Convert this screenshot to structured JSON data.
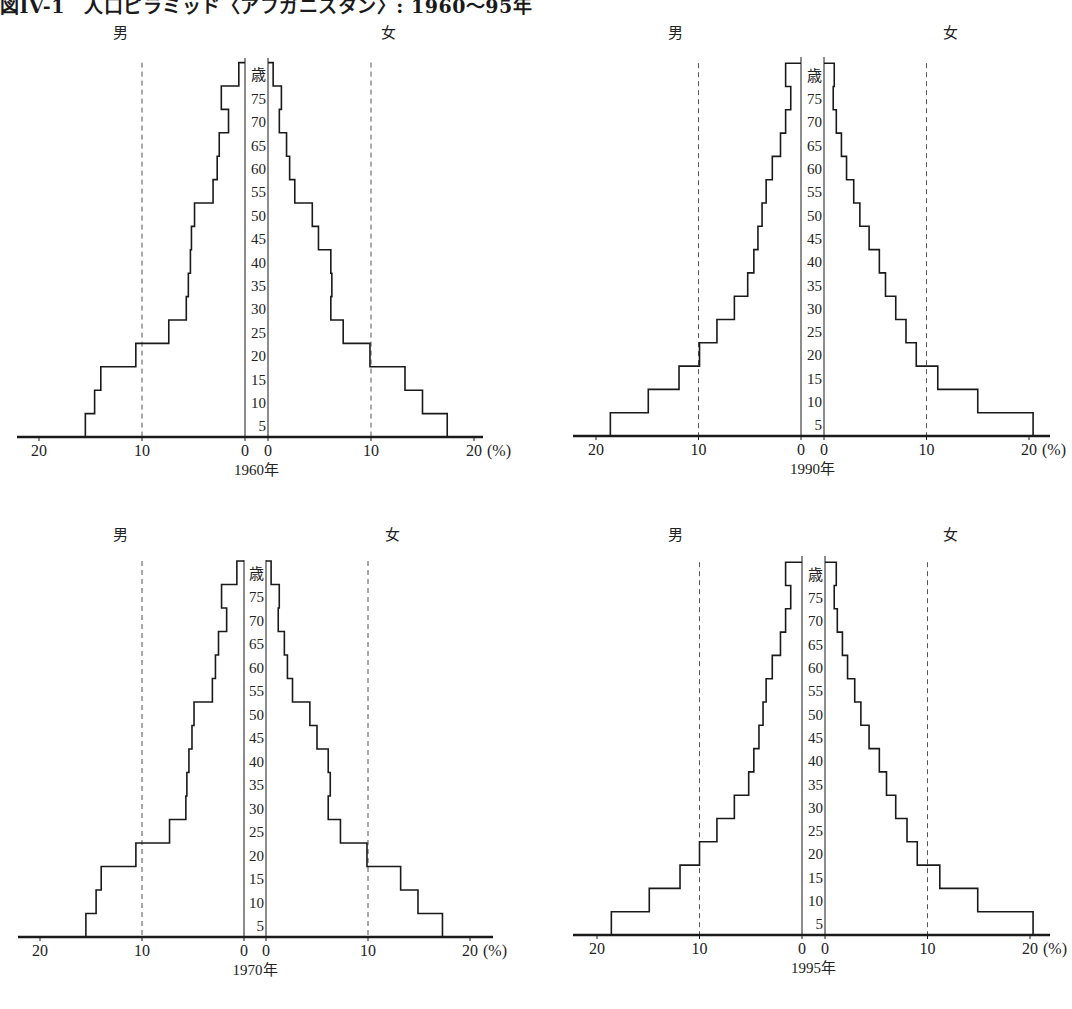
{
  "title": "図IV-1　人口ピラミッド〈アフガニスタン〉: 1960～95年",
  "labels": {
    "male": "男",
    "female": "女",
    "age_unit": "歳",
    "percent_unit": "(%)"
  },
  "chart_data": [
    {
      "type": "population_pyramid",
      "title": "1960年",
      "year": 1960,
      "xlabel": "%",
      "ylabel": "歳",
      "age_bands": [
        "0-4",
        "5-9",
        "10-14",
        "15-19",
        "20-24",
        "25-29",
        "30-34",
        "35-39",
        "40-44",
        "45-49",
        "50-54",
        "55-59",
        "60-64",
        "65-69",
        "70-74",
        "75+"
      ],
      "age_tick_labels": [
        "5",
        "10",
        "15",
        "20",
        "25",
        "30",
        "35",
        "40",
        "45",
        "50",
        "55",
        "60",
        "65",
        "70",
        "75",
        "歳"
      ],
      "x_ticks_male": [
        "20",
        "10",
        "0"
      ],
      "x_ticks_female": [
        "0",
        "10",
        "20"
      ],
      "xlim": [
        0,
        20
      ],
      "gridlines": [
        10
      ],
      "series": [
        {
          "name": "男",
          "values": [
            15.5,
            14.6,
            14.0,
            10.6,
            7.4,
            5.7,
            5.5,
            5.3,
            5.2,
            4.9,
            3.1,
            2.7,
            2.5,
            1.6,
            2.3,
            0.6
          ]
        },
        {
          "name": "女",
          "values": [
            17.4,
            15.0,
            13.3,
            9.9,
            7.3,
            6.1,
            6.2,
            6.1,
            4.9,
            4.3,
            2.6,
            2.1,
            1.8,
            1.1,
            1.3,
            0.5
          ]
        }
      ]
    },
    {
      "type": "population_pyramid",
      "title": "1990年",
      "year": 1990,
      "xlabel": "%",
      "ylabel": "歳",
      "age_bands": [
        "0-4",
        "5-9",
        "10-14",
        "15-19",
        "20-24",
        "25-29",
        "30-34",
        "35-39",
        "40-44",
        "45-49",
        "50-54",
        "55-59",
        "60-64",
        "65-69",
        "70-74",
        "75+"
      ],
      "age_tick_labels": [
        "5",
        "10",
        "15",
        "20",
        "25",
        "30",
        "35",
        "40",
        "45",
        "50",
        "55",
        "60",
        "65",
        "70",
        "75",
        "歳"
      ],
      "x_ticks_male": [
        "20",
        "10",
        "0"
      ],
      "x_ticks_female": [
        "0",
        "10",
        "20"
      ],
      "xlim": [
        0,
        20
      ],
      "gridlines": [
        10
      ],
      "series": [
        {
          "name": "男",
          "values": [
            18.6,
            14.9,
            11.9,
            9.9,
            8.2,
            6.5,
            5.2,
            4.6,
            4.2,
            3.8,
            3.4,
            2.8,
            2.0,
            1.5,
            1.0,
            1.5
          ]
        },
        {
          "name": "女",
          "values": [
            20.4,
            15.0,
            11.1,
            9.0,
            8.0,
            7.0,
            6.0,
            5.4,
            4.4,
            3.5,
            2.9,
            2.2,
            1.7,
            1.2,
            0.9,
            1.0
          ]
        }
      ]
    },
    {
      "type": "population_pyramid",
      "title": "1970年",
      "year": 1970,
      "xlabel": "%",
      "ylabel": "歳",
      "age_bands": [
        "0-4",
        "5-9",
        "10-14",
        "15-19",
        "20-24",
        "25-29",
        "30-34",
        "35-39",
        "40-44",
        "45-49",
        "50-54",
        "55-59",
        "60-64",
        "65-69",
        "70-74",
        "75+"
      ],
      "age_tick_labels": [
        "5",
        "10",
        "15",
        "20",
        "25",
        "30",
        "35",
        "40",
        "45",
        "50",
        "55",
        "60",
        "65",
        "70",
        "75",
        "歳"
      ],
      "x_ticks_male": [
        "20",
        "10",
        "0"
      ],
      "x_ticks_female": [
        "0",
        "10",
        "20"
      ],
      "xlim": [
        0,
        20
      ],
      "gridlines": [
        10
      ],
      "series": [
        {
          "name": "男",
          "values": [
            15.5,
            14.5,
            14.0,
            10.6,
            7.3,
            5.7,
            5.6,
            5.4,
            5.1,
            4.9,
            3.1,
            2.8,
            2.5,
            1.7,
            2.2,
            0.7
          ]
        },
        {
          "name": "女",
          "values": [
            17.3,
            14.9,
            13.2,
            9.9,
            7.3,
            6.1,
            6.3,
            6.1,
            5.0,
            4.3,
            2.6,
            2.1,
            1.8,
            1.2,
            1.3,
            0.5
          ]
        }
      ]
    },
    {
      "type": "population_pyramid",
      "title": "1995年",
      "year": 1995,
      "xlabel": "%",
      "ylabel": "歳",
      "age_bands": [
        "0-4",
        "5-9",
        "10-14",
        "15-19",
        "20-24",
        "25-29",
        "30-34",
        "35-39",
        "40-44",
        "45-49",
        "50-54",
        "55-59",
        "60-64",
        "65-69",
        "70-74",
        "75+"
      ],
      "age_tick_labels": [
        "5",
        "10",
        "15",
        "20",
        "25",
        "30",
        "35",
        "40",
        "45",
        "50",
        "55",
        "60",
        "65",
        "70",
        "75",
        "歳"
      ],
      "x_ticks_male": [
        "20",
        "10",
        "0"
      ],
      "x_ticks_female": [
        "0",
        "10",
        "20"
      ],
      "xlim": [
        0,
        20
      ],
      "gridlines": [
        10
      ],
      "series": [
        {
          "name": "男",
          "values": [
            18.6,
            14.9,
            11.9,
            10.0,
            8.3,
            6.6,
            5.2,
            4.7,
            4.2,
            3.8,
            3.5,
            2.9,
            2.1,
            1.6,
            1.1,
            1.6
          ]
        },
        {
          "name": "女",
          "values": [
            20.3,
            14.9,
            11.2,
            9.0,
            8.0,
            6.9,
            6.0,
            5.3,
            4.3,
            3.5,
            2.9,
            2.2,
            1.7,
            1.2,
            0.9,
            1.1
          ]
        }
      ]
    }
  ],
  "colors": {
    "line": "#1a1a1a",
    "gridline": "#555555",
    "background": "#ffffff"
  }
}
